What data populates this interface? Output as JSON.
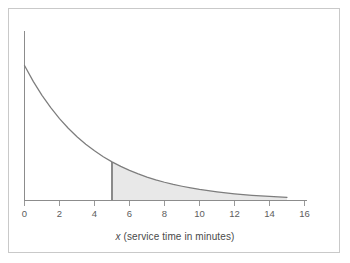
{
  "chart_data": {
    "type": "area",
    "title": "",
    "subtitle": "",
    "xlabel_italic": "x",
    "xlabel_rest": " (service time in minutes)",
    "xlabel_full": "x (service time in minutes)",
    "ylabel": "",
    "xlim": [
      0,
      16
    ],
    "ylim": [
      0,
      0.25
    ],
    "xticks": [
      0,
      2,
      4,
      6,
      8,
      10,
      12,
      14,
      16
    ],
    "xticklabels": [
      "0",
      "2",
      "4",
      "6",
      "8",
      "10",
      "12",
      "14",
      "16"
    ],
    "yticks": [],
    "yticklabels": [],
    "grid": false,
    "legend": null,
    "series": [
      {
        "name": "exponential density",
        "distribution": "exponential",
        "rate": 0.25,
        "domain": [
          0,
          15
        ],
        "x": [
          0,
          0.5,
          1,
          1.5,
          2,
          2.5,
          3,
          3.5,
          4,
          4.5,
          5,
          5.5,
          6,
          6.5,
          7,
          7.5,
          8,
          8.5,
          9,
          9.5,
          10,
          10.5,
          11,
          11.5,
          12,
          12.5,
          13,
          13.5,
          14,
          14.5,
          15
        ],
        "y": [
          0.25,
          0.2206,
          0.1947,
          0.1718,
          0.1516,
          0.1338,
          0.1181,
          0.1042,
          0.092,
          0.0811,
          0.0716,
          0.0632,
          0.0558,
          0.0492,
          0.0434,
          0.0383,
          0.0338,
          0.0298,
          0.0264,
          0.0233,
          0.0205,
          0.0181,
          0.016,
          0.0141,
          0.0124,
          0.011,
          0.0097,
          0.0086,
          0.0076,
          0.0067,
          0.0059
        ]
      }
    ],
    "shaded_region": {
      "label": "tail area",
      "x_start": 5,
      "x_end": 15,
      "fill_color": "#e8e8e8",
      "boundary_x": 5
    },
    "colors": {
      "curve": "#7d7d7d",
      "axis": "#8c8c8c",
      "shade": "#e8e8e8",
      "border": "#c9c9c9",
      "text": "#5d5d5d"
    }
  }
}
